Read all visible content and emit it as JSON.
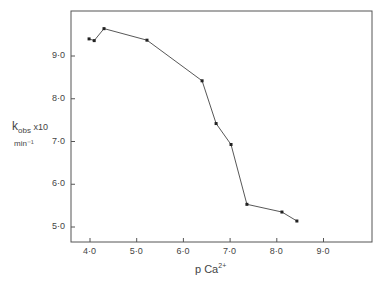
{
  "chart_data": {
    "type": "line",
    "title": "",
    "xlabel": "p Ca2+",
    "ylabel": "k_obs x10 min^-1",
    "xlim": [
      3.6,
      10.0
    ],
    "ylim": [
      4.65,
      10.05
    ],
    "grid": false,
    "legend": null,
    "x_ticks": [
      "4·0",
      "5·0",
      "6·0",
      "7·0",
      "8·0",
      "9·0"
    ],
    "y_ticks": [
      "5·0",
      "6·0",
      "7·0",
      "8·0",
      "9·0"
    ],
    "series": [
      {
        "name": "k_obs",
        "x": [
          3.98,
          4.09,
          4.3,
          5.22,
          6.4,
          6.7,
          7.02,
          7.36,
          8.11,
          8.43
        ],
        "y": [
          9.4,
          9.36,
          9.64,
          9.37,
          8.42,
          7.42,
          6.93,
          5.53,
          5.35,
          5.14
        ]
      }
    ]
  },
  "axes": {
    "ylabel_main": "k",
    "ylabel_sub": "obs",
    "ylabel_mult": " x10",
    "ylabel_unit": "min⁻¹",
    "xlabel_main": "p Ca",
    "xlabel_sup": "2+"
  }
}
